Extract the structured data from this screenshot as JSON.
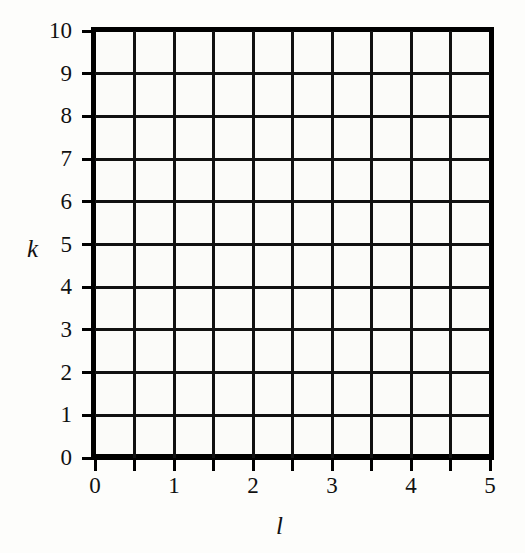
{
  "chart_data": {
    "type": "grid",
    "title": "",
    "subtitle": "",
    "xlabel": "l",
    "ylabel": "k",
    "xlim": [
      0,
      5
    ],
    "ylim": [
      0,
      10
    ],
    "grid": true,
    "legend": null,
    "series": [],
    "annotations": [],
    "x_tick_labels": [
      "0",
      "1",
      "2",
      "3",
      "4",
      "5"
    ],
    "x_tick_values": [
      0,
      1,
      2,
      3,
      4,
      5
    ],
    "x_minor_tick_values": [
      0,
      0.5,
      1,
      1.5,
      2,
      2.5,
      3,
      3.5,
      4,
      4.5,
      5
    ],
    "y_tick_labels": [
      "0",
      "1",
      "2",
      "3",
      "4",
      "5",
      "6",
      "7",
      "8",
      "9",
      "10"
    ],
    "y_tick_values": [
      0,
      1,
      2,
      3,
      4,
      5,
      6,
      7,
      8,
      9,
      10
    ],
    "x_gridline_values": [
      0,
      0.5,
      1,
      1.5,
      2,
      2.5,
      3,
      3.5,
      4,
      4.5,
      5
    ],
    "y_gridline_values": [
      0,
      1,
      2,
      3,
      4,
      5,
      6,
      7,
      8,
      9,
      10
    ],
    "grid_columns": 10,
    "grid_rows": 10,
    "colors": {
      "background": "#fdfdfb",
      "plot_background": "#fbfbf9",
      "frame": "#000000",
      "gridline": "#111111",
      "text": "#111111"
    }
  }
}
